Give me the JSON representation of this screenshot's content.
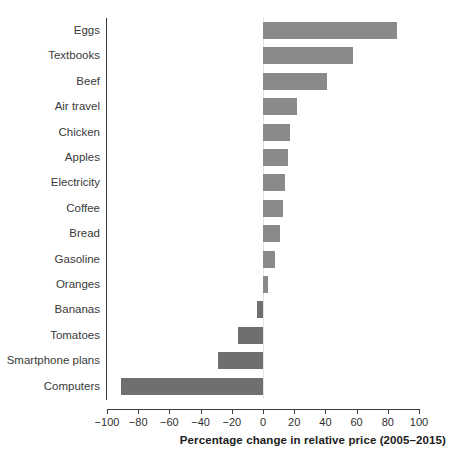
{
  "chart_data": {
    "type": "bar",
    "orientation": "horizontal",
    "title": "",
    "xlabel": "Percentage change in relative price (2005–2015)",
    "ylabel": "",
    "xlim": [
      -100,
      100
    ],
    "xticks": [
      -100,
      -80,
      -60,
      -40,
      -20,
      0,
      20,
      40,
      60,
      80,
      100
    ],
    "xticklabels": [
      "−100",
      "−80",
      "−60",
      "−40",
      "−20",
      "0",
      "20",
      "40",
      "60",
      "80",
      "100"
    ],
    "grid": false,
    "legend": false,
    "bar_color": "#8a8a8a",
    "negative_bar_color": "#6f6f6f",
    "categories": [
      "Eggs",
      "Textbooks",
      "Beef",
      "Air travel",
      "Chicken",
      "Apples",
      "Electricity",
      "Coffee",
      "Bread",
      "Gasoline",
      "Oranges",
      "Bananas",
      "Tomatoes",
      "Smartphone plans",
      "Computers"
    ],
    "values": [
      86,
      58,
      41,
      22,
      17,
      16,
      14,
      13,
      11,
      8,
      3,
      -4,
      -16,
      -29,
      -91
    ]
  }
}
